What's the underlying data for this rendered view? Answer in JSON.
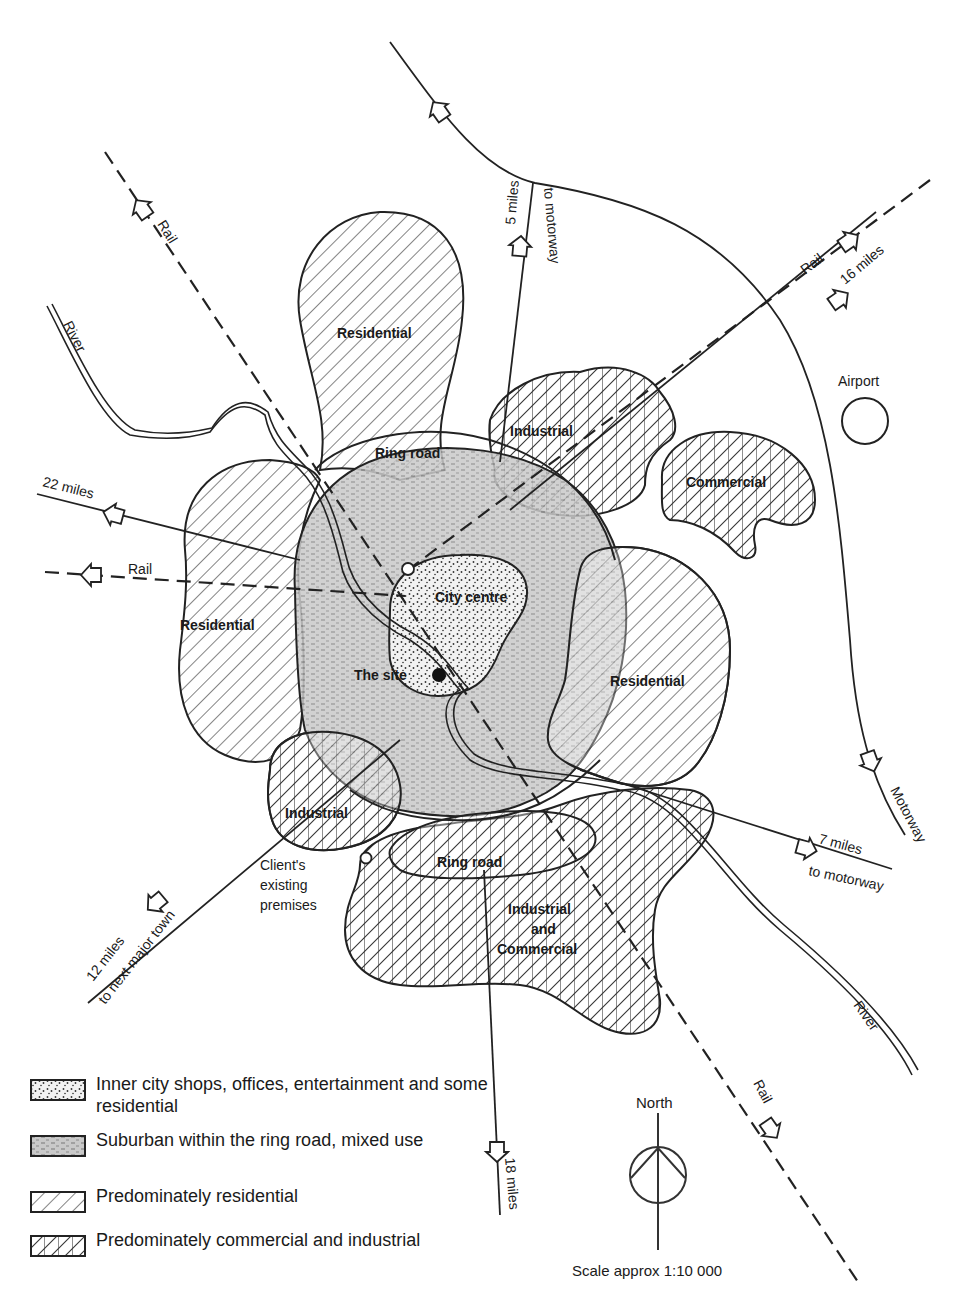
{
  "map": {
    "zones": [
      {
        "id": "residential-north",
        "label": "Residential",
        "type": "residential"
      },
      {
        "id": "industrial-northeast",
        "label": "Industrial",
        "type": "commercial-industrial"
      },
      {
        "id": "commercial-east",
        "label": "Commercial",
        "type": "commercial-industrial"
      },
      {
        "id": "residential-west",
        "label": "Residential",
        "type": "residential"
      },
      {
        "id": "residential-east",
        "label": "Residential",
        "type": "residential"
      },
      {
        "id": "industrial-southwest",
        "label": "Industrial",
        "type": "commercial-industrial"
      },
      {
        "id": "industrial-commercial-south",
        "label_lines": [
          "Industrial",
          "and",
          "Commercial"
        ],
        "type": "commercial-industrial"
      },
      {
        "id": "city-centre",
        "label": "City centre",
        "type": "inner-city"
      },
      {
        "id": "suburban",
        "type": "suburban"
      }
    ],
    "features": {
      "ring_road_north": "Ring road",
      "ring_road_south": "Ring road",
      "site": "The site",
      "airport": "Airport",
      "client_premises_lines": [
        "Client's",
        "existing",
        "premises"
      ]
    },
    "routes": {
      "road_north": {
        "distance": "5 miles",
        "dest": "to motorway"
      },
      "road_northeast": {
        "distance": "16 miles"
      },
      "road_west": {
        "distance": "22 miles"
      },
      "road_east": {
        "distance": "7 miles",
        "dest": "to motorway"
      },
      "road_southwest": {
        "distance": "12 miles",
        "dest": "to next major town"
      },
      "road_south": {
        "distance": "18 miles"
      },
      "rail_nw": "Rail",
      "rail_ne": "Rail",
      "rail_w": "Rail",
      "rail_se": "Rail",
      "river_nw": "River",
      "river_se": "River",
      "motorway": "Motorway"
    }
  },
  "legend": [
    {
      "pattern": "stipple",
      "text": "Inner city shops, offices, entertainment and some residential"
    },
    {
      "pattern": "grey-stipple",
      "text": "Suburban within the ring road, mixed use"
    },
    {
      "pattern": "diagonal",
      "text": "Predominately residential"
    },
    {
      "pattern": "crosshatch",
      "text": "Predominately commercial and industrial"
    }
  ],
  "compass": {
    "label": "North"
  },
  "scale": {
    "text": "Scale approx 1:10 000"
  }
}
